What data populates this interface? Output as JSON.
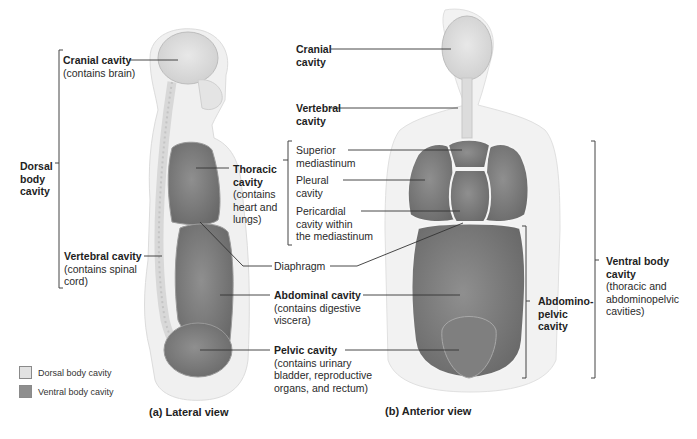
{
  "figure": {
    "lateral_view": {
      "caption": "(a) Lateral view",
      "labels": {
        "cranial": {
          "title": "Cranial cavity",
          "sub": "(contains brain)"
        },
        "dorsal": {
          "line1": "Dorsal",
          "line2": "body",
          "line3": "cavity"
        },
        "vertebral": {
          "title": "Vertebral cavity",
          "sub1": "(contains spinal",
          "sub2": "cord)"
        },
        "thoracic": {
          "line1": "Thoracic",
          "line2": "cavity",
          "sub1": "(contains",
          "sub2": "heart and",
          "sub3": "lungs)"
        },
        "diaphragm": "Diaphragm",
        "abdominal": {
          "title": "Abdominal cavity",
          "sub1": "(contains digestive",
          "sub2": "viscera)"
        },
        "pelvic": {
          "title": "Pelvic cavity",
          "sub1": "(contains urinary",
          "sub2": "bladder, reproductive",
          "sub3": "organs, and rectum)"
        }
      }
    },
    "anterior_view": {
      "caption": "(b) Anterior view",
      "labels": {
        "cranial": {
          "line1": "Cranial",
          "line2": "cavity"
        },
        "vertebral": {
          "line1": "Vertebral",
          "line2": "cavity"
        },
        "superior_mediastinum": {
          "line1": "Superior",
          "line2": "mediastinum"
        },
        "pleural": {
          "line1": "Pleural",
          "line2": "cavity"
        },
        "pericardial": {
          "line1": "Pericardial",
          "line2": "cavity within",
          "line3": "the mediastinum"
        },
        "abdominopelvic": {
          "line1": "Abdomino-",
          "line2": "pelvic",
          "line3": "cavity"
        },
        "ventral": {
          "line1": "Ventral body",
          "line2": "cavity",
          "sub1": "(thoracic and",
          "sub2": "abdominopelvic",
          "sub3": "cavities)"
        }
      }
    },
    "legend": [
      {
        "label": "Dorsal body cavity",
        "color": "#e2e2e2"
      },
      {
        "label": "Ventral body cavity",
        "color": "#8e8e8e"
      }
    ],
    "colors": {
      "dorsal": "#e2e2e2",
      "ventral": "#8e8e8e",
      "body": "#efefef",
      "leader": "#333333"
    }
  }
}
